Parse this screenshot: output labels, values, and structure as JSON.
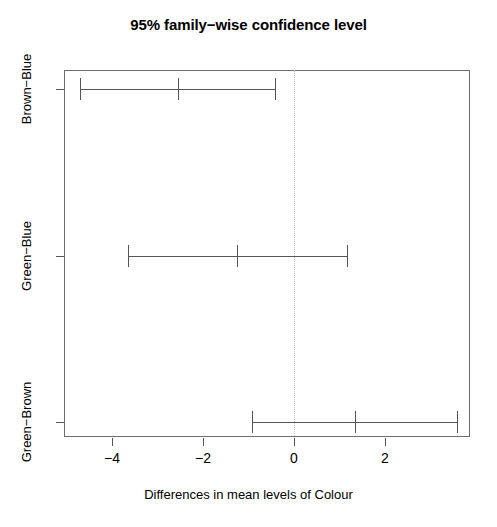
{
  "chart_data": {
    "type": "scatter",
    "plot_kind": "tukey-hsd-confidence-intervals",
    "title": "95% family−wise confidence level",
    "xlabel": "Differences in mean levels of Colour",
    "ylabel": "",
    "xlim": [
      -5.07,
      3.87
    ],
    "xticks": [
      -4,
      -2,
      0,
      2
    ],
    "xticklabels": [
      "−4",
      "−2",
      "0",
      "2"
    ],
    "grid": false,
    "legend": false,
    "zero_reference_line": {
      "value": 0,
      "style": "dotted",
      "color": "#c4c4c4"
    },
    "categories": [
      "Brown−Blue",
      "Green−Blue",
      "Green−Brown"
    ],
    "series": [
      {
        "name": "difference",
        "values": [
          -2.55,
          -1.25,
          1.34
        ]
      },
      {
        "name": "lower",
        "values": [
          -4.7,
          -3.65,
          -0.92
        ]
      },
      {
        "name": "upper",
        "values": [
          -0.42,
          1.16,
          3.58
        ]
      }
    ],
    "intervals": [
      {
        "comparison": "Brown−Blue",
        "diff": -2.55,
        "lwr": -4.7,
        "upr": -0.42,
        "crosses_zero": false
      },
      {
        "comparison": "Green−Blue",
        "diff": -1.25,
        "lwr": -3.65,
        "upr": 1.16,
        "crosses_zero": true
      },
      {
        "comparison": "Green−Brown",
        "diff": 1.34,
        "lwr": -0.92,
        "upr": 3.58,
        "crosses_zero": true
      }
    ]
  },
  "colors": {
    "line": "#555555",
    "axis": "#6e6e6e",
    "zero": "#c4c4c4",
    "text": "#000000",
    "background": "#ffffff"
  },
  "geometry": {
    "panel": {
      "left": 64,
      "top": 70,
      "right": 470,
      "bottom": 437
    },
    "x_origin_px": 294,
    "px_per_unit": 45.5,
    "row_y_px": [
      89,
      256,
      422
    ]
  }
}
